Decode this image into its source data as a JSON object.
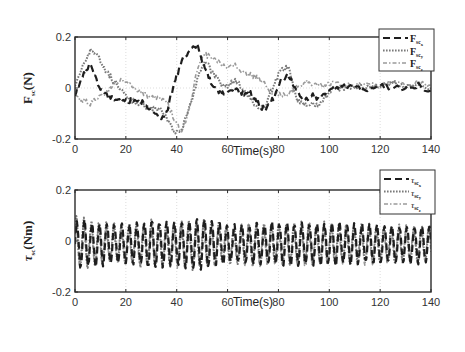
{
  "figure": {
    "background": "#ffffff",
    "line_colors": {
      "x": "#1e1e1e",
      "y": "#7a7a7a",
      "z": "#9a9a9a"
    }
  },
  "chart_data": [
    {
      "type": "line",
      "title": "",
      "xlabel": "Time(s)",
      "ylabel": "F_sc(N)",
      "ylabel_main": "F",
      "ylabel_sub": "sc",
      "ylabel_unit": "(N)",
      "xlim": [
        0,
        140
      ],
      "ylim": [
        -0.2,
        0.2
      ],
      "xticks": [
        0,
        20,
        40,
        60,
        80,
        100,
        120,
        140
      ],
      "xtick_labels": [
        "0",
        "20",
        "40",
        "60",
        "80",
        "100",
        "120",
        "140"
      ],
      "yticks": [
        -0.2,
        0,
        0.2
      ],
      "ytick_labels": [
        "-0.2",
        "0",
        "0.2"
      ],
      "grid": true,
      "legend_position": "upper right (outside-overlapping)",
      "legend": [
        "F_sc_x",
        "F_sc_y",
        "F_sc_z"
      ],
      "legend_labels": [
        {
          "main": "F",
          "sub": "sc",
          "subsub": "x",
          "style": "dashed"
        },
        {
          "main": "F",
          "sub": "sc",
          "subsub": "y",
          "style": "dotted"
        },
        {
          "main": "F",
          "sub": "sc",
          "subsub": "z",
          "style": "dashdot"
        }
      ],
      "series": [
        {
          "name": "F_sc_x",
          "style": "dashed",
          "x": [
            0,
            3,
            6,
            9,
            12,
            15,
            18,
            21,
            24,
            27,
            30,
            33,
            36,
            39,
            42,
            45,
            48,
            51,
            54,
            57,
            60,
            63,
            66,
            69,
            72,
            75,
            78,
            81,
            84,
            87,
            90,
            93,
            96,
            99,
            102,
            105,
            110,
            115,
            120,
            125,
            130,
            135,
            140
          ],
          "y": [
            -0.02,
            0.05,
            0.09,
            0.02,
            -0.03,
            -0.04,
            -0.05,
            -0.05,
            -0.05,
            -0.06,
            -0.09,
            -0.12,
            -0.1,
            0.02,
            0.11,
            0.15,
            0.17,
            0.08,
            0.01,
            -0.02,
            -0.02,
            -0.01,
            -0.02,
            -0.02,
            -0.06,
            -0.09,
            -0.04,
            0.03,
            0.05,
            -0.01,
            -0.05,
            -0.03,
            -0.04,
            -0.01,
            0.0,
            0.01,
            0.0,
            -0.01,
            0.01,
            0.0,
            0.0,
            0.01,
            -0.01
          ]
        },
        {
          "name": "F_sc_y",
          "style": "dotted",
          "x": [
            0,
            3,
            6,
            9,
            12,
            15,
            18,
            21,
            24,
            27,
            30,
            33,
            36,
            39,
            42,
            45,
            48,
            51,
            54,
            57,
            60,
            63,
            66,
            69,
            72,
            75,
            78,
            81,
            84,
            87,
            90,
            93,
            96,
            99,
            102,
            105,
            110,
            115,
            120,
            125,
            130,
            135,
            140
          ],
          "y": [
            0.0,
            0.08,
            0.15,
            0.13,
            0.07,
            0.03,
            0.0,
            -0.04,
            -0.06,
            -0.07,
            -0.08,
            -0.08,
            -0.12,
            -0.17,
            -0.16,
            -0.08,
            0.03,
            0.11,
            0.06,
            0.02,
            0.01,
            0.03,
            0.0,
            -0.04,
            -0.09,
            -0.07,
            0.01,
            0.07,
            0.08,
            -0.04,
            -0.07,
            -0.06,
            -0.07,
            -0.03,
            0.0,
            0.0,
            0.01,
            0.0,
            0.01,
            0.02,
            0.0,
            0.01,
            0.0
          ]
        },
        {
          "name": "F_sc_z",
          "style": "dashdot",
          "x": [
            0,
            3,
            6,
            9,
            12,
            15,
            18,
            21,
            24,
            27,
            30,
            33,
            36,
            39,
            42,
            45,
            48,
            51,
            54,
            57,
            60,
            63,
            66,
            69,
            72,
            75,
            78,
            81,
            84,
            87,
            90,
            93,
            96,
            99,
            102,
            105,
            110,
            115,
            120,
            125,
            130,
            135,
            140
          ],
          "y": [
            -0.03,
            -0.05,
            -0.06,
            -0.04,
            -0.02,
            0.01,
            0.03,
            0.02,
            0.0,
            -0.02,
            -0.04,
            -0.04,
            -0.05,
            -0.12,
            -0.18,
            -0.08,
            0.07,
            0.13,
            0.12,
            0.1,
            0.08,
            0.09,
            0.06,
            0.05,
            0.04,
            0.01,
            -0.02,
            -0.03,
            -0.02,
            0.0,
            0.02,
            0.02,
            0.01,
            0.01,
            0.02,
            0.01,
            0.01,
            0.02,
            0.01,
            0.02,
            0.01,
            0.02,
            0.01
          ]
        }
      ]
    },
    {
      "type": "line",
      "title": "",
      "xlabel": "Time(s)",
      "ylabel": "τ_sc(Nm)",
      "ylabel_main": "τ",
      "ylabel_sub": "sc",
      "ylabel_unit": "(Nm)",
      "xlim": [
        0,
        140
      ],
      "ylim": [
        -0.2,
        0.2
      ],
      "xticks": [
        0,
        20,
        40,
        60,
        80,
        100,
        120,
        140
      ],
      "xtick_labels": [
        "0",
        "20",
        "40",
        "60",
        "80",
        "100",
        "120",
        "140"
      ],
      "yticks": [
        -0.2,
        0,
        0.2
      ],
      "ytick_labels": [
        "-0.2",
        "0",
        "0.2"
      ],
      "grid": true,
      "legend_position": "upper right (outside-overlapping)",
      "legend": [
        "τ_sc_x",
        "τ_sc_y",
        "τ_sc_z"
      ],
      "legend_labels": [
        {
          "main": "τ",
          "sub": "sc",
          "subsub": "x",
          "style": "dashed"
        },
        {
          "main": "τ",
          "sub": "sc",
          "subsub": "y",
          "style": "dotted"
        },
        {
          "main": "τ",
          "sub": "sc",
          "subsub": "z",
          "style": "dashdot"
        }
      ],
      "series": [
        {
          "name": "τ_sc_x",
          "style": "dashed",
          "kind": "oscillation",
          "period_s": 2.95,
          "phase": 0.0,
          "offset": 0.0,
          "amplitude_envelope": {
            "t": [
              0,
              10,
              20,
              30,
              40,
              50,
              60,
              80,
              100,
              120,
              140
            ],
            "a": [
              0.09,
              0.08,
              0.07,
              0.09,
              0.08,
              0.1,
              0.07,
              0.08,
              0.08,
              0.07,
              0.07
            ]
          }
        },
        {
          "name": "τ_sc_y",
          "style": "dotted",
          "kind": "oscillation",
          "period_s": 2.95,
          "phase": 0.35,
          "offset": 0.0,
          "amplitude_envelope": {
            "t": [
              0,
              10,
              20,
              30,
              40,
              50,
              60,
              80,
              100,
              120,
              140
            ],
            "a": [
              0.1,
              0.08,
              0.07,
              0.09,
              0.08,
              0.1,
              0.07,
              0.08,
              0.08,
              0.07,
              0.07
            ]
          }
        },
        {
          "name": "τ_sc_z",
          "style": "dashdot",
          "kind": "oscillation",
          "period_s": 2.95,
          "phase": 0.7,
          "offset": -0.005,
          "amplitude_envelope": {
            "t": [
              0,
              10,
              20,
              30,
              40,
              50,
              60,
              80,
              100,
              120,
              140
            ],
            "a": [
              0.09,
              0.07,
              0.06,
              0.08,
              0.08,
              0.09,
              0.07,
              0.08,
              0.07,
              0.07,
              0.06
            ]
          }
        }
      ]
    }
  ]
}
